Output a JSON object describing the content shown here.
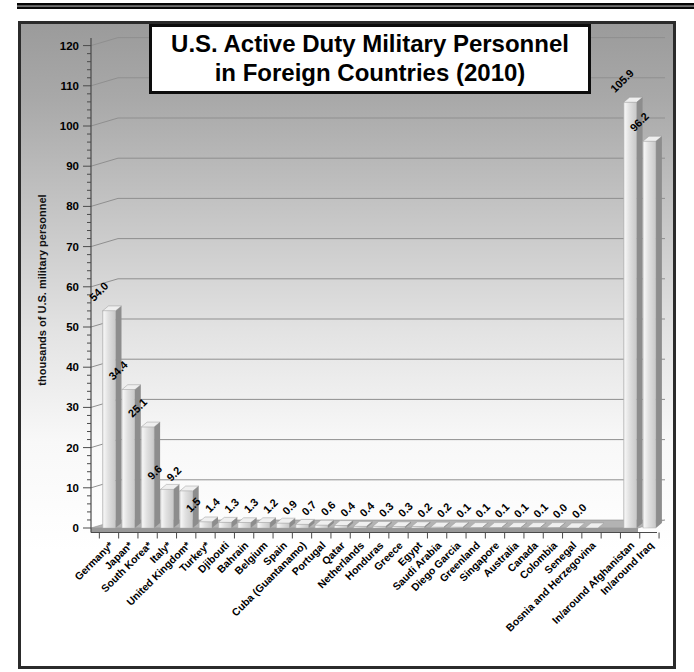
{
  "chart_data": {
    "type": "bar",
    "title_line1": "U.S. Active Duty Military Personnel",
    "title_line2": "in Foreign Countries (2010)",
    "ylabel": "thousands of U.S. military personnel",
    "ylim": [
      0,
      120
    ],
    "ytick_step": 10,
    "ytick_minor_step": 2,
    "ytick_labels": [
      "0",
      "10",
      "20",
      "30",
      "40",
      "50",
      "60",
      "70",
      "80",
      "90",
      "100",
      "110",
      "120"
    ],
    "grid": true,
    "legend": "none",
    "categories": [
      "Germany*",
      "Japan*",
      "South Korea*",
      "Italy*",
      "United Kingdom*",
      "Turkey*",
      "Djibouti",
      "Bahrain",
      "Belgium",
      "Spain",
      "Cuba (Guantanamo)",
      "Portugal",
      "Qatar",
      "Netherlands",
      "Honduras",
      "Greece",
      "Egypt",
      "Saudi Arabia",
      "Diego Garcia",
      "Greenland",
      "Singapore",
      "Australia",
      "Canada",
      "Colombia",
      "Senegal",
      "Bosnia and Herzegovina",
      "",
      "In/around Afghanistan",
      "In/around Iraq"
    ],
    "values": [
      54.0,
      34.4,
      25.1,
      9.6,
      9.2,
      1.5,
      1.4,
      1.3,
      1.3,
      1.2,
      0.9,
      0.7,
      0.6,
      0.4,
      0.4,
      0.3,
      0.3,
      0.2,
      0.2,
      0.1,
      0.1,
      0.1,
      0.1,
      0.1,
      0.0,
      0.0,
      null,
      105.9,
      96.2
    ],
    "value_labels": [
      "54.0",
      "34.4",
      "25.1",
      "9.6",
      "9.2",
      "1.5",
      "1.4",
      "1.3",
      "1.3",
      "1.2",
      "0.9",
      "0.7",
      "0.6",
      "0.4",
      "0.4",
      "0.3",
      "0.3",
      "0.2",
      "0.2",
      "0.1",
      "0.1",
      "0.1",
      "0.1",
      "0.1",
      "0.0",
      "0.0",
      "",
      "105.9",
      "96.2"
    ],
    "colors": {
      "bar_front_light": "#f2f2f2",
      "bar_front_mid": "#dadada",
      "bar_front_dark": "#c6c6c6",
      "bar_side": "#8d8d8d",
      "bar_top": "#efefef",
      "floor": "#b3b3b3",
      "floor_front": "#989898",
      "gridline": "#8f8f8f",
      "axis": "#4a4a4a",
      "text": "#000000",
      "frame_border": "#2b2b2b",
      "title_border": "#0d0d0d"
    }
  }
}
